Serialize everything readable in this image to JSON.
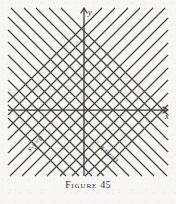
{
  "figure": {
    "caption_word": "Figure",
    "caption_number": "45",
    "caption_full": "FIGURE 45",
    "background_color": "#f7f6f4",
    "ink_color": "#4a4744",
    "axis_color": "#3b3835"
  },
  "axes": {
    "x_label": "x",
    "y_label": "y",
    "origin": {
      "x": 84,
      "y": 110
    },
    "x_axis": {
      "x_start": 8,
      "x_end": 168,
      "y": 110,
      "arrow": "right"
    },
    "y_axis": {
      "y_start": 8,
      "y_end": 176,
      "x": 84,
      "arrow": "up"
    }
  },
  "labels": [
    {
      "name": "line-family-x-minus-y",
      "text": "x-y=0",
      "equation": "x - y = 0",
      "slope": 1,
      "rotation_deg": -45,
      "position": {
        "x": 30,
        "y": 152
      }
    },
    {
      "name": "line-family-x-plus-y",
      "text": "x+y=0",
      "equation": "x + y = 0",
      "slope": -1,
      "rotation_deg": 45,
      "position": {
        "x": 100,
        "y": 148
      }
    }
  ],
  "chart_data": {
    "type": "line",
    "title": "FIGURE 45",
    "xlabel": "x",
    "ylabel": "y",
    "grid": false,
    "legend": "none",
    "families": [
      {
        "name": "x-y=c",
        "label": "x-y=0",
        "slope": 1,
        "angle_deg": 45,
        "spacing_px": 12.5,
        "count": 14,
        "offsets": [
          -84,
          -71,
          -58,
          -46,
          -33,
          -21,
          -8,
          4,
          17,
          29,
          42,
          54,
          67,
          79
        ]
      },
      {
        "name": "x+y=c",
        "label": "x+y=0",
        "slope": -1,
        "angle_deg": -45,
        "spacing_px": 12.5,
        "count": 14,
        "offsets": [
          -84,
          -71,
          -58,
          -46,
          -33,
          -21,
          -8,
          4,
          17,
          29,
          42,
          54,
          67,
          79
        ]
      }
    ],
    "plot_bounds": {
      "left": 8,
      "right": 168,
      "top": 8,
      "bottom": 176
    }
  }
}
